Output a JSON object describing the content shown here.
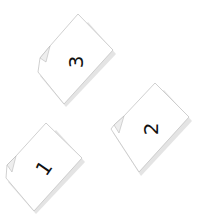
{
  "pages": [
    {
      "id": "page-3",
      "number": "3",
      "rotation": -60
    },
    {
      "id": "page-2",
      "number": "2",
      "rotation": -60
    },
    {
      "id": "page-1",
      "number": "1",
      "rotation": -60
    }
  ],
  "colors": {
    "background": "#ffffff",
    "page_fill": "#ffffff",
    "page_stroke": "#c8c8c8",
    "shadow": "#dcdcdc",
    "number": "#111111"
  }
}
